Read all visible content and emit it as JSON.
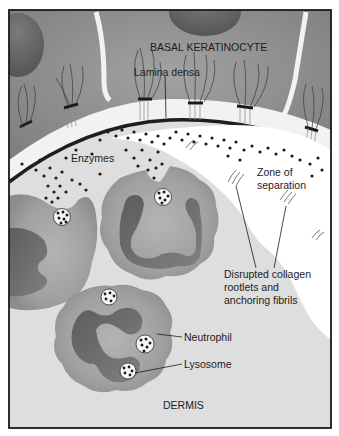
{
  "figure": {
    "labels": {
      "basal_keratinocyte": "BASAL KERATINOCYTE",
      "lamina_densa": "Lamina densa",
      "enzymes": "Enzymes",
      "zone_of_separation": "Zone of\nseparation",
      "disrupted_collagen": "Disrupted collagen\nrootlets and\nanchoring fibrils",
      "neutrophil": "Neutrophil",
      "lysosome": "Lysosome",
      "dermis": "DERMIS"
    },
    "colors": {
      "frame": "#1a1a1a",
      "keratinocyte": "#8d8d8d",
      "nucleus_top": "#6a6a6a",
      "basement_gap": "#f4f4f4",
      "lamina_densa": "#1e1e1e",
      "dermis": "#dcdcdc",
      "separation_zone": "#ffffff",
      "neutrophil_cytoplasm": "#9e9e9e",
      "neutrophil_nucleus": "#6e6e6e",
      "granule": "#1c1c1c"
    }
  }
}
